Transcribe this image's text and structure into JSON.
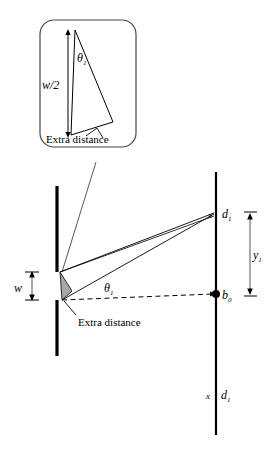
{
  "figure": {
    "type": "optics-single-slit-diffraction-geometry",
    "background_color": "#ffffff",
    "ink_color": "#000000",
    "thin_line_color": "#333333",
    "shade_color": "#a8a8a8",
    "width": 277,
    "height": 458
  },
  "inset": {
    "name": "magnified-slit-detail",
    "box": {
      "x": 40,
      "y": 20,
      "width": 96,
      "height": 127,
      "corner_radius": 14
    },
    "labels": {
      "half_width": "w/2",
      "angle": "θ",
      "angle_subscript": "1",
      "extra_distance": "Extra distance"
    },
    "triangle": {
      "apex_top": [
        75,
        30
      ],
      "vertex_bottom": [
        71,
        135
      ],
      "vertex_right": [
        113,
        122
      ]
    },
    "dimension_arrow": {
      "x": 68,
      "y_top": 30,
      "y_bottom": 137,
      "double_headed": true
    },
    "leader_line": {
      "from": [
        96,
        162
      ],
      "to": [
        62,
        272
      ]
    }
  },
  "main": {
    "name": "main-diffraction-geometry",
    "barrier": {
      "name": "slit-barrier",
      "x": 57,
      "upper_segment": {
        "y_top": 186,
        "y_bottom": 272
      },
      "lower_segment": {
        "y_top": 300,
        "y_bottom": 356
      },
      "thickness": 3
    },
    "screen": {
      "name": "observation-screen",
      "x": 216,
      "y_top": 172,
      "y_bottom": 435,
      "thickness": 2
    },
    "slit": {
      "top_edge": [
        60,
        272
      ],
      "bottom_edge": [
        62,
        300
      ],
      "width_label": "w"
    },
    "rays": [
      {
        "name": "ray-from-top-edge",
        "from": [
          60,
          272
        ],
        "to": [
          214,
          214
        ]
      },
      {
        "name": "ray-from-bottom-edge",
        "from": [
          62,
          300
        ],
        "to": [
          214,
          214
        ]
      }
    ],
    "axis": {
      "name": "optical-axis",
      "from": [
        62,
        300
      ],
      "to": [
        216,
        294
      ],
      "style": "dashed"
    },
    "shaded_triangle": {
      "name": "extra-distance-wedge",
      "points": [
        [
          60,
          272
        ],
        [
          62,
          300
        ],
        [
          71,
          292
        ]
      ]
    },
    "angle_label": {
      "text": "θ",
      "subscript": "1",
      "x": 108,
      "y": 291
    },
    "extra_distance_label": {
      "text": "Extra distance",
      "x": 78,
      "y": 321,
      "leader_from": [
        76,
        315
      ],
      "leader_to": [
        64,
        300
      ]
    },
    "width_dimension": {
      "name": "slit-width-dimension",
      "x": 32,
      "y_top": 272,
      "y_bottom": 300,
      "label": "w",
      "double_headed": true
    }
  },
  "screen_markers": [
    {
      "name": "upper-maximum-marker",
      "cross": "x",
      "label": "d",
      "subscript": "1",
      "x": 216,
      "y": 214
    },
    {
      "name": "central-maximum-marker",
      "label": "b",
      "subscript": "0",
      "x": 216,
      "y": 294
    },
    {
      "name": "lower-maximum-marker",
      "cross": "x",
      "label": "d",
      "subscript": "1",
      "x": 216,
      "y": 395
    }
  ],
  "y_dimension": {
    "name": "y1-dimension",
    "label": "y",
    "subscript": "1",
    "x": 250,
    "y_top": 214,
    "y_bottom": 294,
    "double_headed": true
  }
}
